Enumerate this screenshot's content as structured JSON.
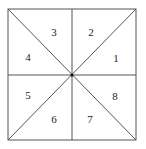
{
  "diagram": {
    "type": "square divided into 8 triangular regions by midlines and diagonals",
    "square": {
      "x1": 8,
      "y1": 9,
      "x2": 136,
      "y2": 140
    },
    "center": {
      "x": 72,
      "y": 75
    },
    "line_color": "#555555",
    "regions": [
      {
        "label": "1",
        "x": 116,
        "y": 58
      },
      {
        "label": "2",
        "x": 91,
        "y": 32
      },
      {
        "label": "3",
        "x": 54,
        "y": 32
      },
      {
        "label": "4",
        "x": 28,
        "y": 57
      },
      {
        "label": "5",
        "x": 28,
        "y": 95
      },
      {
        "label": "6",
        "x": 54,
        "y": 119
      },
      {
        "label": "7",
        "x": 90,
        "y": 119
      },
      {
        "label": "8",
        "x": 115,
        "y": 96
      }
    ]
  }
}
